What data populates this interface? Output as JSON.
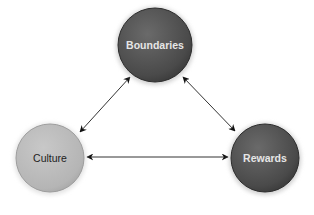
{
  "diagram": {
    "nodes": [
      {
        "id": "boundaries",
        "label": "Boundaries",
        "cx": 155,
        "cy": 45,
        "r": 37,
        "fill": "#555555",
        "text_color": "#e6e6e6"
      },
      {
        "id": "culture",
        "label": "Culture",
        "cx": 50,
        "cy": 158,
        "r": 34,
        "fill": "#bdbdbd",
        "text_color": "#222222"
      },
      {
        "id": "rewards",
        "label": "Rewards",
        "cx": 265,
        "cy": 158,
        "r": 34,
        "fill": "#555555",
        "text_color": "#e6e6e6"
      }
    ],
    "edges": [
      {
        "from": "culture",
        "to": "boundaries",
        "type": "bidirectional"
      },
      {
        "from": "boundaries",
        "to": "rewards",
        "type": "bidirectional"
      },
      {
        "from": "culture",
        "to": "rewards",
        "type": "bidirectional"
      }
    ]
  }
}
